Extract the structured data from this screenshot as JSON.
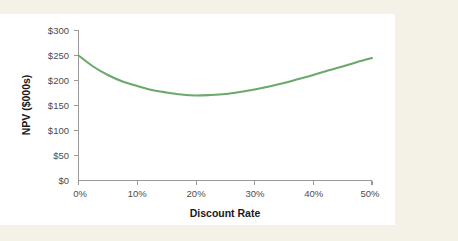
{
  "page": {
    "background_color": "#f4f2e6",
    "panel_color": "#ffffff"
  },
  "chart_data": {
    "type": "line",
    "title": "",
    "subtitle": "",
    "xlabel": "Discount Rate",
    "ylabel": "NPV ($000s)",
    "xlim": [
      0,
      50
    ],
    "ylim": [
      0,
      300
    ],
    "grid": false,
    "legend": false,
    "legend_position": "none",
    "x_tick_labels": [
      "0%",
      "10%",
      "20%",
      "30%",
      "40%",
      "50%"
    ],
    "x_tick_values": [
      0,
      10,
      20,
      30,
      40,
      50
    ],
    "y_tick_labels": [
      "$0",
      "$50",
      "$100",
      "$150",
      "$200",
      "$250",
      "$300"
    ],
    "y_tick_values": [
      0,
      50,
      100,
      150,
      200,
      250,
      300
    ],
    "series": [
      {
        "name": "NPV",
        "color": "#6ba86b",
        "x": [
          0,
          2.5,
          5,
          7.5,
          10,
          12.5,
          15,
          17.5,
          20,
          22.5,
          25,
          27.5,
          30,
          32.5,
          35,
          37.5,
          40,
          42.5,
          45,
          47.5,
          50
        ],
        "values": [
          250,
          228,
          211,
          198,
          189,
          181,
          176,
          172,
          170,
          171,
          173,
          177,
          182,
          188,
          195,
          203,
          211,
          220,
          228,
          237,
          245
        ]
      }
    ],
    "annotations": []
  },
  "axis": {
    "line_color": "#9a9a9a",
    "tick_label_color": "#4d4d4d",
    "title_color": "#1a1a1a"
  }
}
